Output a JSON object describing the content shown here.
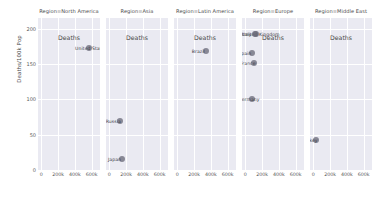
{
  "chart_data": {
    "type": "scatter",
    "title": "",
    "xlabel": "Deaths",
    "ylabel": "Deaths/100k Pop",
    "facet_variable": "Region",
    "xlim": [
      -40000,
      700000
    ],
    "ylim": [
      0,
      215
    ],
    "grid": true,
    "legend": "none",
    "xticks": [
      {
        "value": 0,
        "label": "0"
      },
      {
        "value": 200000,
        "label": "200k"
      },
      {
        "value": 400000,
        "label": "400k"
      },
      {
        "value": 600000,
        "label": "600k"
      }
    ],
    "yticks": [
      {
        "value": 0,
        "label": "0"
      },
      {
        "value": 50,
        "label": "50"
      },
      {
        "value": 100,
        "label": "100"
      },
      {
        "value": 150,
        "label": "150"
      },
      {
        "value": 200,
        "label": "200"
      }
    ],
    "point_color": "#6b6b7b",
    "panel_background": "#eaeaf2",
    "grid_color": "#ffffff",
    "panels": [
      {
        "title": "Region=North America",
        "region": "North America",
        "points": [
          {
            "label": "United States",
            "x": 570000,
            "y": 172
          }
        ]
      },
      {
        "title": "Region=Asia",
        "region": "Asia",
        "points": [
          {
            "label": "Russia",
            "x": 125000,
            "y": 70
          },
          {
            "label": "Japan",
            "x": 150000,
            "y": 15
          }
        ]
      },
      {
        "title": "Region=Latin America",
        "region": "Latin America",
        "points": [
          {
            "label": "Brazil",
            "x": 340000,
            "y": 168
          }
        ]
      },
      {
        "title": "Region=Europe",
        "region": "Europe",
        "points": [
          {
            "label": "United Kingdom",
            "x": 128000,
            "y": 192
          },
          {
            "label": "Italy",
            "x": 120000,
            "y": 192
          },
          {
            "label": "Spain",
            "x": 82000,
            "y": 165
          },
          {
            "label": "France",
            "x": 103000,
            "y": 152
          },
          {
            "label": "Germany",
            "x": 80000,
            "y": 101
          }
        ]
      },
      {
        "title": "Region=Middle East",
        "region": "Middle East",
        "points": [
          {
            "label": "Turkey",
            "x": 36000,
            "y": 42
          }
        ]
      }
    ]
  }
}
